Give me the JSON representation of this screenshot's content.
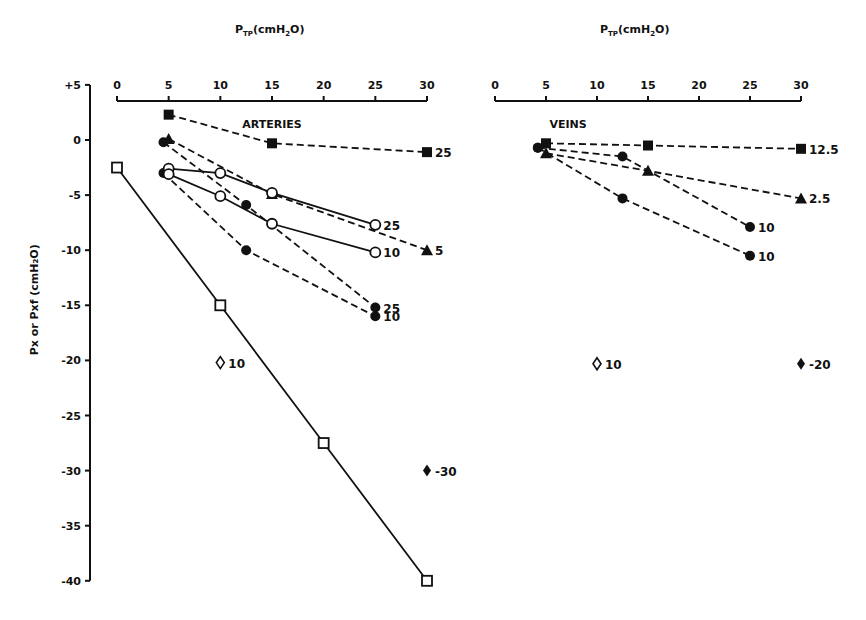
{
  "chart_data": [
    {
      "type": "line",
      "panel": "ARTERIES",
      "title": "ARTERIES",
      "xlabel": "P_TP (cmH2O)",
      "ylabel": "Px or Pxf (cmH2O)",
      "xlim": [
        0,
        30
      ],
      "ylim": [
        -40,
        5
      ],
      "x_ticks": [
        0,
        5,
        10,
        15,
        20,
        25,
        30
      ],
      "y_ticks": [
        "+5",
        "0",
        "-5",
        "-10",
        "-15",
        "-20",
        "-25",
        "-30",
        "-35",
        "-40"
      ],
      "x_axis_position": "top",
      "grid": false,
      "series": [
        {
          "name": "filled square 25",
          "marker": "filled-square",
          "line": "dashed",
          "end_label": "25",
          "x": [
            5,
            15,
            30
          ],
          "y": [
            2.3,
            -0.3,
            -1.1
          ]
        },
        {
          "name": "filled triangle 5",
          "marker": "filled-triangle",
          "line": "dashed",
          "end_label": "5",
          "x": [
            5,
            15,
            30
          ],
          "y": [
            0.1,
            -4.9,
            -10
          ]
        },
        {
          "name": "filled circle 25",
          "marker": "filled-circle",
          "line": "dashed",
          "end_label": "25",
          "x": [
            4.5,
            12.5,
            25
          ],
          "y": [
            -0.2,
            -5.9,
            -15.2
          ]
        },
        {
          "name": "filled circle 10",
          "marker": "filled-circle",
          "line": "dashed",
          "end_label": "10",
          "x": [
            4.5,
            12.5,
            25
          ],
          "y": [
            -3.0,
            -10.0,
            -16.0
          ]
        },
        {
          "name": "open circle 25",
          "marker": "open-circle",
          "line": "solid",
          "end_label": "25",
          "x": [
            5,
            10,
            15,
            25
          ],
          "y": [
            -2.6,
            -3.0,
            -4.8,
            -7.7
          ]
        },
        {
          "name": "open circle 10",
          "marker": "open-circle",
          "line": "solid",
          "end_label": "10",
          "x": [
            5,
            10,
            15,
            25
          ],
          "y": [
            -3.1,
            -5.1,
            -7.6,
            -10.2
          ]
        },
        {
          "name": "open square",
          "marker": "open-square",
          "line": "solid",
          "end_label": "",
          "x": [
            0,
            10,
            20,
            30
          ],
          "y": [
            -2.5,
            -15,
            -27.5,
            -40
          ]
        },
        {
          "name": "open diamond 10",
          "marker": "open-diamond",
          "line": "none",
          "end_label": "10",
          "x": [
            10
          ],
          "y": [
            -20.2
          ]
        },
        {
          "name": "filled diamond -30",
          "marker": "filled-diamond",
          "line": "none",
          "end_label": "-30",
          "x": [
            30
          ],
          "y": [
            -30
          ]
        }
      ]
    },
    {
      "type": "line",
      "panel": "VEINS",
      "title": "VEINS",
      "xlabel": "P_TP (cmH2O)",
      "ylabel": "Px or Pxf (cmH2O)",
      "xlim": [
        0,
        30
      ],
      "ylim": [
        -40,
        5
      ],
      "x_ticks": [
        0,
        5,
        10,
        15,
        20,
        25,
        30
      ],
      "x_axis_position": "top",
      "grid": false,
      "series": [
        {
          "name": "filled square 12.5",
          "marker": "filled-square",
          "line": "dashed",
          "end_label": "12.5",
          "x": [
            5,
            15,
            30
          ],
          "y": [
            -0.3,
            -0.5,
            -0.8
          ]
        },
        {
          "name": "filled triangle 2.5",
          "marker": "filled-triangle",
          "line": "dashed",
          "end_label": "2.5",
          "x": [
            5,
            15,
            30
          ],
          "y": [
            -1.2,
            -2.8,
            -5.3
          ]
        },
        {
          "name": "filled circle 10 (upper)",
          "marker": "filled-circle",
          "line": "dashed",
          "end_label": "10",
          "x": [
            4.2,
            12.5,
            25
          ],
          "y": [
            -0.7,
            -1.5,
            -7.9
          ]
        },
        {
          "name": "filled circle 10 (lower)",
          "marker": "filled-circle",
          "line": "dashed",
          "end_label": "10",
          "x": [
            4.2,
            12.5,
            25
          ],
          "y": [
            -0.7,
            -5.3,
            -10.5
          ]
        },
        {
          "name": "open diamond 10",
          "marker": "open-diamond",
          "line": "none",
          "end_label": "10",
          "x": [
            10
          ],
          "y": [
            -20.3
          ]
        },
        {
          "name": "filled diamond -20",
          "marker": "filled-diamond",
          "line": "none",
          "end_label": "-20",
          "x": [
            30
          ],
          "y": [
            -20.3
          ]
        }
      ]
    }
  ],
  "labels": {
    "xlabel_left": "P",
    "xlabel_left_sub": "TP",
    "xlabel_left_unit": "(cmH",
    "xlabel_left_sub2": "2",
    "xlabel_left_end": "O)",
    "ylabel": "Px or Pxf (cmH₂O)",
    "arteries_title": "ARTERIES",
    "veins_title": "VEINS"
  }
}
